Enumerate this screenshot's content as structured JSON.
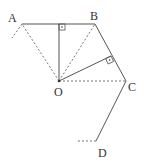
{
  "diagram": {
    "type": "geometry",
    "points": {
      "A": {
        "label": "A",
        "x": 22,
        "y": 24
      },
      "B": {
        "label": "B",
        "x": 95,
        "y": 24
      },
      "C": {
        "label": "C",
        "x": 126,
        "y": 81
      },
      "D": {
        "label": "D",
        "x": 96,
        "y": 141
      },
      "O": {
        "label": "O",
        "x": 59,
        "y": 81
      }
    },
    "solid_segments": [
      [
        "A",
        "B"
      ],
      [
        "B",
        "C"
      ],
      [
        "C",
        "D"
      ],
      [
        "O",
        "foot_AB"
      ],
      [
        "O",
        "foot_BC"
      ]
    ],
    "dashed_segments": [
      [
        "O",
        "A"
      ],
      [
        "O",
        "B"
      ],
      [
        "O",
        "C"
      ],
      [
        "A",
        "left_end"
      ],
      [
        "D",
        "d_end"
      ]
    ],
    "right_angles": [
      "foot_AB",
      "foot_BC"
    ],
    "colors": {
      "line": "#555555",
      "dash": "#777777",
      "text": "#333333"
    }
  }
}
